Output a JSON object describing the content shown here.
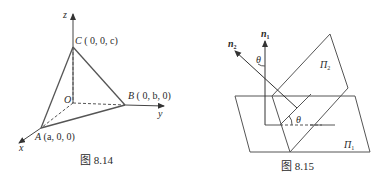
{
  "figures": [
    {
      "caption": "图 8.14",
      "axes": {
        "x": "x",
        "y": "y",
        "z": "z"
      },
      "origin_label": "O",
      "points": {
        "A": {
          "name": "A",
          "coords": "(a, 0, 0)"
        },
        "B": {
          "name": "B",
          "coords": "( 0, b, 0)"
        },
        "C": {
          "name": "C",
          "coords": "( 0, 0, c)"
        }
      }
    },
    {
      "caption": "图 8.15",
      "normals": {
        "n1": "n",
        "n1_sub": "1",
        "n2": "n",
        "n2_sub": "2"
      },
      "planes": {
        "p1": "Π",
        "p1_sub": "1",
        "p2": "Π",
        "p2_sub": "2"
      },
      "angle_label": "θ"
    }
  ],
  "colors": {
    "line": "#555555",
    "text": "#2a2a2a",
    "background": "#ffffff"
  }
}
